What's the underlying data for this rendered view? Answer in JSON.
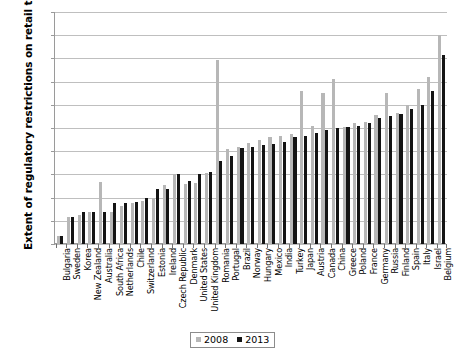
{
  "chart_data": {
    "type": "bar",
    "title": "",
    "xlabel": "",
    "ylabel": "Extent of regulatory restrictions on retail trade",
    "ylim": [
      0,
      5
    ],
    "ytick_labels": [
      "0.00",
      "0.50",
      "1.00",
      "1.50",
      "2.00",
      "2.50",
      "3.00",
      "3.50",
      "4.00",
      "4.50",
      "5.00"
    ],
    "ytick_values": [
      0,
      0.5,
      1.0,
      1.5,
      2.0,
      2.5,
      3.0,
      3.5,
      4.0,
      4.5,
      5.0
    ],
    "grid": true,
    "legend_position": "bottom-center",
    "categories": [
      "Bulgaria",
      "Sweden",
      "Korea",
      "New Zealand",
      "Australia",
      "South Africa",
      "Netherlands",
      "Chile",
      "Switzerland",
      "Estonia",
      "Ireland",
      "Czech Republic",
      "Denmark",
      "United States",
      "United Kingdom",
      "Romania",
      "Portugal",
      "Brazil",
      "Norway",
      "Hungary",
      "Mexico",
      "India",
      "Turkey",
      "Japan",
      "Austria",
      "Canada",
      "China",
      "Greece",
      "Poland",
      "France",
      "Germany",
      "Russia",
      "Finland",
      "Spain",
      "Italy",
      "Israel",
      "Belgium"
    ],
    "series": [
      {
        "name": "2008",
        "color": "#b7b7b7",
        "values": [
          0.17,
          0.59,
          0.62,
          0.68,
          1.33,
          0.7,
          0.82,
          0.88,
          0.92,
          1.0,
          1.28,
          1.5,
          1.3,
          1.32,
          1.52,
          3.97,
          2.05,
          2.1,
          2.18,
          2.24,
          2.3,
          2.33,
          2.38,
          3.3,
          2.55,
          3.25,
          3.55,
          2.52,
          2.6,
          2.62,
          2.78,
          3.25,
          2.82,
          3.0,
          3.35,
          3.6,
          4.5
        ]
      },
      {
        "name": "2013",
        "color": "#141414",
        "values": [
          0.17,
          0.59,
          0.68,
          0.68,
          0.7,
          0.88,
          0.88,
          0.9,
          1.0,
          1.18,
          1.18,
          1.5,
          1.35,
          1.5,
          1.55,
          1.78,
          1.9,
          2.08,
          2.1,
          2.13,
          2.15,
          2.2,
          2.3,
          2.32,
          2.4,
          2.45,
          2.5,
          2.52,
          2.55,
          2.6,
          2.72,
          2.75,
          2.8,
          2.9,
          3.0,
          3.3,
          4.07
        ]
      }
    ],
    "legend": [
      {
        "label": "2008",
        "color": "#b7b7b7"
      },
      {
        "label": "2013",
        "color": "#141414"
      }
    ]
  }
}
